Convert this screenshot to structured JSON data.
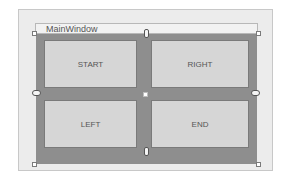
{
  "designer": {
    "window": {
      "title": "MainWindow"
    },
    "grid": {
      "rows": 2,
      "columns": 2,
      "cells": [
        {
          "label": "START",
          "row": 0,
          "col": 0
        },
        {
          "label": "RIGHT",
          "row": 0,
          "col": 1
        },
        {
          "label": "LEFT",
          "row": 1,
          "col": 0
        },
        {
          "label": "END",
          "row": 1,
          "col": 1
        }
      ]
    },
    "handles": [
      "top-anchor",
      "left-anchor",
      "right-anchor",
      "bottom-anchor",
      "center-splitter",
      "resize-top-left",
      "resize-top-right",
      "resize-bottom-left",
      "resize-bottom-right"
    ],
    "colors": {
      "canvas": "#ececec",
      "grid_background": "#8e8e8e",
      "panel": "#d6d6d6",
      "text": "#555555"
    }
  }
}
